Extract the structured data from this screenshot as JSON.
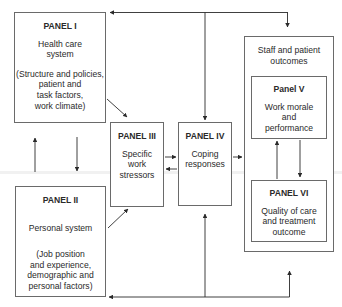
{
  "diagram": {
    "panel_1": {
      "title": "PANEL I",
      "subtitle": "Health care\nsystem",
      "details": "(Structure and policies,\npatient and\ntask factors,\nwork climate)"
    },
    "panel_2": {
      "title": "PANEL II",
      "subtitle": "Personal system",
      "details": "(Job position\nand experience,\ndemographic and\npersonal factors)"
    },
    "panel_3": {
      "title": "PANEL III",
      "subtitle": "Specific\nwork\nstressors"
    },
    "panel_4": {
      "title": "PANEL IV",
      "subtitle": "Coping\nresponses"
    },
    "outcomes_group": {
      "title": "Staff and patient\noutcomes"
    },
    "panel_5": {
      "title": "Panel V",
      "subtitle": "Work morale\nand\nperformance"
    },
    "panel_6": {
      "title": "PANEL VI",
      "subtitle": "Quality of care\nand treatment\noutcome"
    },
    "colors": {
      "line": "#2a2a2a",
      "box_border": "#6a6a6a",
      "text": "#2a2a2a"
    }
  }
}
